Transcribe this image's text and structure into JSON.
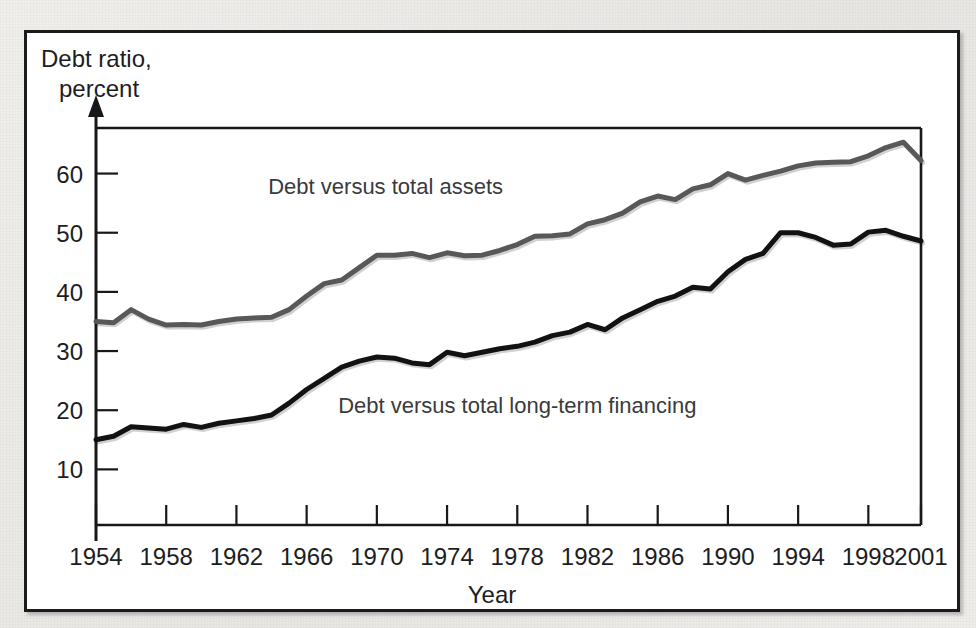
{
  "chart_data": {
    "type": "line",
    "title": "",
    "xlabel": "Year",
    "ylabel": "Debt ratio, percent",
    "ylabel_line1": "Debt ratio,",
    "ylabel_line2": "percent",
    "xlim": [
      1954,
      2001
    ],
    "ylim": [
      0,
      70
    ],
    "y_ticks": [
      10,
      20,
      30,
      40,
      50,
      60
    ],
    "x_ticks": [
      1954,
      1958,
      1962,
      1966,
      1970,
      1974,
      1978,
      1982,
      1986,
      1990,
      1994,
      1998,
      2001
    ],
    "grid": false,
    "legend_position": "inline-annotation",
    "x": [
      1954,
      1955,
      1956,
      1957,
      1958,
      1959,
      1960,
      1961,
      1962,
      1963,
      1964,
      1965,
      1966,
      1967,
      1968,
      1969,
      1970,
      1971,
      1972,
      1973,
      1974,
      1975,
      1976,
      1977,
      1978,
      1979,
      1980,
      1981,
      1982,
      1983,
      1984,
      1985,
      1986,
      1987,
      1988,
      1989,
      1990,
      1991,
      1992,
      1993,
      1994,
      1995,
      1996,
      1997,
      1998,
      1999,
      2000,
      2001
    ],
    "series": [
      {
        "name": "Debt versus total assets",
        "label": "Debt versus total assets",
        "color": "#58585a",
        "stroke_width": 5,
        "values": [
          35.0,
          34.8,
          37.0,
          35.4,
          34.4,
          34.5,
          34.4,
          35.0,
          35.4,
          35.6,
          35.7,
          37.0,
          39.3,
          41.4,
          42.0,
          44.1,
          46.2,
          46.2,
          46.5,
          45.8,
          46.6,
          46.1,
          46.2,
          47.0,
          48.0,
          49.4,
          49.5,
          49.8,
          51.5,
          52.2,
          53.3,
          55.2,
          56.2,
          55.6,
          57.4,
          58.1,
          60.0,
          58.9,
          59.7,
          60.4,
          61.3,
          61.8,
          61.9,
          62.0,
          63.0,
          64.4,
          65.3,
          62.2
        ]
      },
      {
        "name": "Debt versus total long-term financing",
        "label": "Debt versus total long-term financing",
        "color": "#121214",
        "stroke_width": 5,
        "values": [
          15.0,
          15.6,
          17.2,
          17.0,
          16.8,
          17.6,
          17.1,
          17.8,
          18.2,
          18.6,
          19.2,
          21.2,
          23.5,
          25.4,
          27.3,
          28.3,
          29.0,
          28.8,
          28.0,
          27.7,
          29.8,
          29.2,
          29.8,
          30.4,
          30.8,
          31.5,
          32.6,
          33.2,
          34.5,
          33.6,
          35.6,
          37.0,
          38.4,
          39.3,
          40.8,
          40.5,
          43.4,
          45.5,
          46.5,
          50.0,
          50.0,
          49.2,
          47.9,
          48.1,
          50.1,
          50.4,
          49.4,
          48.6
        ]
      }
    ],
    "annotations": [
      {
        "text": "Debt versus total assets",
        "x": 1970.5,
        "y": 56.5
      },
      {
        "text": "Debt versus total long-term financing",
        "x": 1978.0,
        "y": 19.5
      }
    ]
  },
  "geometry": {
    "plot_left": 93,
    "plot_right": 918,
    "plot_top": 123,
    "plot_bottom": 520,
    "y_value_top": 67.7,
    "y_value_bottom": 0.6
  }
}
